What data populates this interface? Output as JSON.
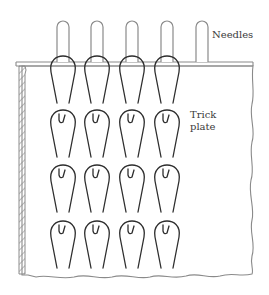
{
  "diagram": {
    "type": "knitting-mechanism-illustration",
    "labels": {
      "needles": "Needles",
      "trick_plate_line1": "Trick",
      "trick_plate_line2": "plate"
    },
    "needle_count": 5,
    "loop_columns": 4,
    "loop_rows": 4,
    "colors": {
      "needle_stroke": "#8a8a8a",
      "loop_stroke": "#2e2e2e",
      "plate_stroke": "#8a8a8a",
      "hatch": "#8a8a8a",
      "background": "#ffffff"
    }
  }
}
